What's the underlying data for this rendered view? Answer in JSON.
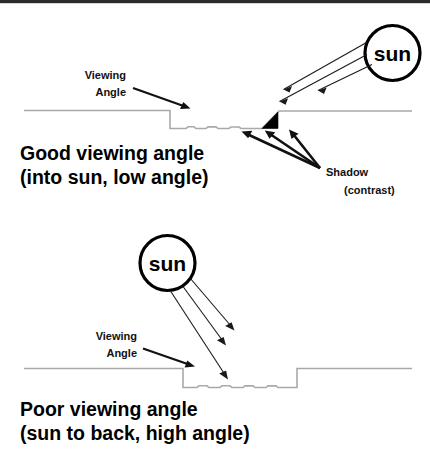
{
  "figure": {
    "top_border_color": "#2b2b2b",
    "background_color": "#ffffff"
  },
  "panels": [
    {
      "id": "good",
      "sun_label": "sun",
      "viewing_label_line1": "Viewing",
      "viewing_label_line2": "Angle",
      "shadow_label_line1": "Shadow",
      "shadow_label_line2": "(contrast)",
      "caption_line1": "Good viewing angle",
      "caption_line2": "(into sun, low angle)",
      "sun_position": "upper-right",
      "sun_rays": 3,
      "shadow_visible": true,
      "shadow_color": "#000000"
    },
    {
      "id": "poor",
      "sun_label": "sun",
      "viewing_label_line1": "Viewing",
      "viewing_label_line2": "Angle",
      "caption_line1": "Poor viewing angle",
      "caption_line2": "(sun to back, high angle)",
      "sun_position": "upper-middle",
      "sun_rays": 3,
      "shadow_visible": false
    }
  ],
  "colors": {
    "ground_line": "#a9a9a9",
    "ink": "#111111",
    "shadow": "#000000"
  }
}
